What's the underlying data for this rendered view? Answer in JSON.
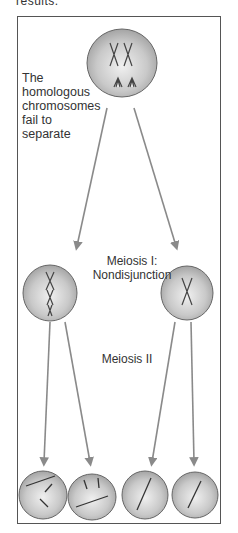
{
  "header": {
    "cutoff_text": "results."
  },
  "labels": {
    "fail_to_separate": [
      "The",
      "homologous",
      "chromosomes",
      "fail to",
      "separate"
    ],
    "meiosis_one": [
      "Meiosis I:",
      "Nondisjunction"
    ],
    "meiosis_two": "Meiosis II"
  },
  "cells": [
    {
      "id": "parent-cell",
      "stage": "Meiosis I start",
      "chromosomes": "2 homologous pairs, failing to separate"
    },
    {
      "id": "daughter-left",
      "stage": "After Meiosis I",
      "chromosomes": "extra chromosome pair"
    },
    {
      "id": "daughter-right",
      "stage": "After Meiosis I",
      "chromosomes": "single chromosome"
    },
    {
      "id": "gamete-1",
      "stage": "After Meiosis II",
      "chromosomes": "extra"
    },
    {
      "id": "gamete-2",
      "stage": "After Meiosis II",
      "chromosomes": "extra"
    },
    {
      "id": "gamete-3",
      "stage": "After Meiosis II",
      "chromosomes": "normal"
    },
    {
      "id": "gamete-4",
      "stage": "After Meiosis II",
      "chromosomes": "normal"
    }
  ],
  "colors": {
    "cell_fill": "#b8b8b8",
    "cell_highlight": "#ececec",
    "arrow": "#8a8a8a",
    "frame": "#555555",
    "text": "#333333"
  }
}
